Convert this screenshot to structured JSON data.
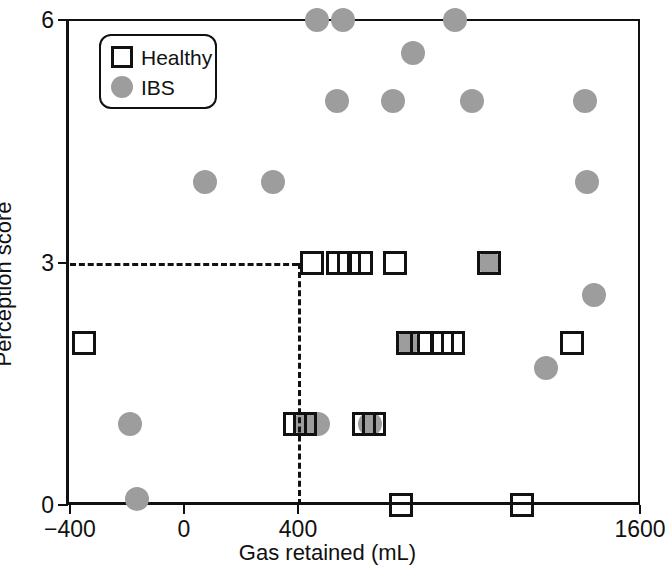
{
  "chart_data": {
    "type": "scatter",
    "title": "",
    "xlabel": "Gas retained (mL)",
    "ylabel": "Perception score",
    "xlim": [
      -400,
      1600
    ],
    "ylim": [
      0,
      6
    ],
    "xticks": [
      -400,
      0,
      400,
      1600
    ],
    "xticklabels": [
      "−400",
      "0",
      "400",
      "1600"
    ],
    "yticks": [
      0,
      3,
      6
    ],
    "yticklabels": [
      "0",
      "3",
      "6"
    ],
    "grid": false,
    "legend_position": "top-left",
    "annotations": [
      {
        "name": "threshold-horizontal",
        "type": "dashed-line",
        "orientation": "horizontal",
        "y": 3,
        "x_from": -400,
        "x_to": 400
      },
      {
        "name": "threshold-vertical",
        "type": "dashed-line",
        "orientation": "vertical",
        "x": 400,
        "y_from": 0,
        "y_to": 3
      }
    ],
    "series": [
      {
        "name": "Healthy",
        "marker": "open-square",
        "color": "#111111",
        "points": [
          [
            450,
            3
          ],
          [
            540,
            3
          ],
          [
            580,
            3
          ],
          [
            620,
            3
          ],
          [
            740,
            3
          ],
          [
            1070,
            3
          ],
          [
            -350,
            2
          ],
          [
            785,
            2
          ],
          [
            835,
            2
          ],
          [
            905,
            2
          ],
          [
            945,
            2
          ],
          [
            1360,
            2
          ],
          [
            390,
            1
          ],
          [
            425,
            1
          ],
          [
            630,
            1
          ],
          [
            665,
            1
          ],
          [
            760,
            0
          ],
          [
            1185,
            0
          ]
        ]
      },
      {
        "name": "IBS",
        "marker": "filled-circle",
        "color": "#9D9D9D",
        "points": [
          [
            467,
            6
          ],
          [
            558,
            6
          ],
          [
            951,
            6
          ],
          [
            803,
            5.6
          ],
          [
            537,
            5
          ],
          [
            733,
            5
          ],
          [
            1010,
            5
          ],
          [
            1407,
            5
          ],
          [
            74,
            4
          ],
          [
            312,
            4
          ],
          [
            1414,
            4
          ],
          [
            1070,
            3
          ],
          [
            1440,
            2.6
          ],
          [
            785,
            2
          ],
          [
            1270,
            1.7
          ],
          [
            -190,
            1
          ],
          [
            425,
            1
          ],
          [
            470,
            1
          ],
          [
            652,
            1
          ],
          [
            -165,
            0.08
          ]
        ]
      }
    ]
  },
  "legend": {
    "items": [
      {
        "label": "Healthy",
        "symbol": "open-square"
      },
      {
        "label": "IBS",
        "symbol": "filled-circle"
      }
    ]
  }
}
